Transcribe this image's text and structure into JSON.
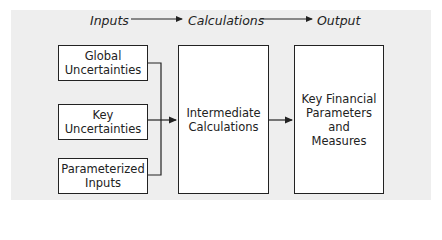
{
  "header": {
    "stages": [
      "Inputs",
      "Calculations",
      "Output"
    ]
  },
  "inputs": [
    {
      "label": "Global\nUncertainties"
    },
    {
      "label": "Key\nUncertainties"
    },
    {
      "label": "Parameterized\nInputs"
    }
  ],
  "calculations": {
    "label": "Intermediate\nCalculations"
  },
  "output": {
    "label": "Key Financial\nParameters\nand\nMeasures"
  },
  "colors": {
    "background": "#eeeeee",
    "box_fill": "#ffffff",
    "stroke": "#222222"
  }
}
